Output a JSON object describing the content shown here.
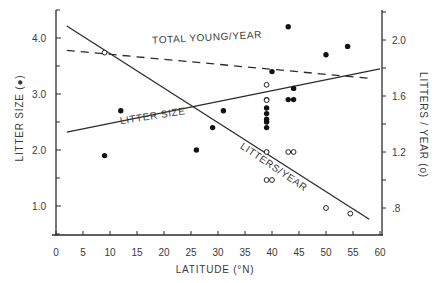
{
  "chart_data": {
    "type": "scatter",
    "title": "",
    "xlabel": "LATITUDE (°N)",
    "ylabel": "LITTER SIZE (●)",
    "ylabel_right": "LITTERS / YEAR (o)",
    "xlim": [
      0,
      60
    ],
    "ylim": [
      0.5,
      4.5
    ],
    "ylim_right": [
      0.6,
      2.2
    ],
    "grid": false,
    "legend": "none (inline line labels)",
    "x_ticks": [
      0,
      5,
      10,
      15,
      20,
      25,
      30,
      35,
      40,
      45,
      50,
      55,
      60
    ],
    "x_tick_labels": [
      "0",
      "5",
      "10",
      "15",
      "20",
      "25",
      "30",
      "35",
      "40",
      "45",
      "50",
      "55",
      "60"
    ],
    "y_ticks": [
      1.0,
      2.0,
      3.0,
      4.0
    ],
    "y_tick_labels": [
      "1.0",
      "2.0",
      "3.0",
      "4.0"
    ],
    "y_minor_ticks": [
      0.5,
      1.5,
      2.5,
      3.5,
      4.5
    ],
    "y_right_ticks": [
      0.8,
      1.2,
      1.6,
      2.0
    ],
    "y_right_tick_labels": [
      ".8",
      "1.2",
      "1.6",
      "2.0"
    ],
    "y_right_minor_ticks": [
      1.0,
      1.4,
      1.8,
      2.2
    ],
    "series": [
      {
        "name": "Litter size (●)",
        "marker": "filled-circle",
        "axis": "left",
        "points": [
          [
            9,
            1.9
          ],
          [
            12,
            2.7
          ],
          [
            26,
            2.0
          ],
          [
            29,
            2.4
          ],
          [
            31,
            2.7
          ],
          [
            39,
            2.9
          ],
          [
            39,
            2.75
          ],
          [
            39,
            2.65
          ],
          [
            39,
            2.55
          ],
          [
            39,
            2.5
          ],
          [
            39,
            2.4
          ],
          [
            40,
            3.4
          ],
          [
            43,
            4.2
          ],
          [
            43,
            2.9
          ],
          [
            44,
            2.9
          ],
          [
            44,
            3.1
          ],
          [
            50,
            3.7
          ],
          [
            54,
            3.85
          ]
        ]
      },
      {
        "name": "Litters/year (o)",
        "marker": "open-circle",
        "axis": "right",
        "points": [
          [
            9,
            1.91
          ],
          [
            39,
            1.68
          ],
          [
            39,
            1.57
          ],
          [
            39,
            1.2
          ],
          [
            43,
            1.2
          ],
          [
            44,
            1.2
          ],
          [
            39,
            1.0
          ],
          [
            40,
            1.0
          ],
          [
            50,
            0.8
          ],
          [
            54.5,
            0.76
          ]
        ]
      }
    ],
    "fit_lines": [
      {
        "name": "LITTER SIZE",
        "style": "solid",
        "axis": "left",
        "from": [
          2,
          2.32
        ],
        "to": [
          60,
          3.45
        ]
      },
      {
        "name": "LITTERS/YEAR",
        "style": "solid",
        "axis": "right",
        "from": [
          2,
          2.1
        ],
        "to": [
          58,
          0.72
        ]
      },
      {
        "name": "TOTAL YOUNG/YEAR",
        "style": "dashed",
        "axis": "left",
        "from": [
          2,
          3.78
        ],
        "to": [
          58,
          3.28
        ]
      }
    ],
    "annotations": [
      {
        "text": "TOTAL YOUNG/YEAR",
        "x": 28,
        "y": 3.95,
        "rotate": -3
      },
      {
        "text": "LITTER SIZE",
        "x": 18,
        "y": 2.55,
        "rotate": -9
      },
      {
        "text": "LITTERS/YEAR",
        "x": 40,
        "y": 1.65,
        "rotate": 34
      }
    ]
  }
}
